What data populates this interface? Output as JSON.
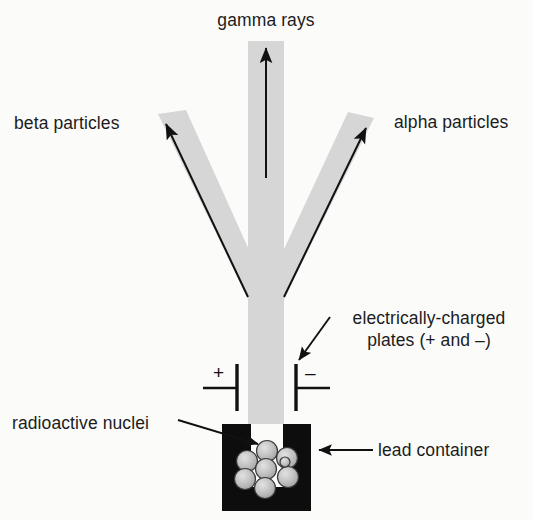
{
  "figure": {
    "background_color": "#fbfbfa",
    "beam_color": "#d6d6d6",
    "ink_color": "#111111",
    "nuclei_fill": "#b8b8b8"
  },
  "labels": {
    "gamma_rays": "gamma rays",
    "beta_particles": "beta particles",
    "alpha_particles": "alpha particles",
    "charged_plates_line1": "electrically-charged",
    "charged_plates_line2": "plates (+ and –)",
    "radioactive_nuclei": "radioactive nuclei",
    "lead_container": "lead container"
  },
  "plate_signs": {
    "left": "+",
    "right": "–"
  },
  "diagram_elements": {
    "beams": [
      {
        "name": "gamma-beam",
        "direction": "vertical-up",
        "deflection": "none"
      },
      {
        "name": "beta-beam",
        "direction": "up-left",
        "deflection": "toward-positive-plate"
      },
      {
        "name": "alpha-beam",
        "direction": "up-right",
        "deflection": "toward-negative-plate"
      }
    ],
    "nuclei_count": 8,
    "container_material": "lead"
  }
}
